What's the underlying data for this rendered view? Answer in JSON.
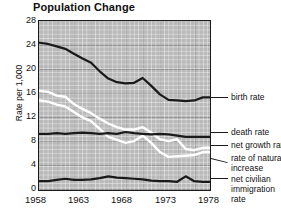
{
  "chart_data": {
    "type": "line",
    "title": "Population Change",
    "xlabel": "",
    "ylabel": "Rate per 1,000",
    "xlim": [
      1958,
      1978
    ],
    "ylim": [
      0,
      28
    ],
    "yticks": [
      0,
      4,
      8,
      12,
      16,
      20,
      24,
      28
    ],
    "xticks": [
      1958,
      1963,
      1968,
      1973,
      1978
    ],
    "grid": true,
    "legend_position": "right-inline-labels",
    "x": [
      1958,
      1959,
      1960,
      1961,
      1962,
      1963,
      1964,
      1965,
      1966,
      1967,
      1968,
      1969,
      1970,
      1971,
      1972,
      1973,
      1974,
      1975,
      1976,
      1977,
      1978
    ],
    "series": [
      {
        "name": "birth rate",
        "color": "#1a1a1a",
        "values": [
          24.5,
          24.3,
          23.9,
          23.5,
          22.7,
          21.9,
          21.2,
          19.8,
          18.6,
          18.0,
          17.8,
          17.9,
          18.7,
          17.4,
          16.0,
          15.1,
          15.0,
          14.9,
          15.0,
          15.5,
          15.5
        ]
      },
      {
        "name": "death rate",
        "color": "#1a1a1a",
        "values": [
          9.5,
          9.5,
          9.6,
          9.5,
          9.6,
          9.7,
          9.6,
          9.5,
          9.6,
          9.5,
          9.8,
          9.6,
          9.5,
          9.4,
          9.5,
          9.4,
          9.2,
          9.0,
          9.0,
          9.0,
          9.0
        ]
      },
      {
        "name": "net growth rate",
        "color": "#ffffff",
        "values": [
          16.6,
          16.4,
          15.8,
          15.6,
          14.4,
          13.6,
          12.9,
          12.0,
          11.2,
          10.6,
          10.2,
          10.2,
          10.6,
          9.7,
          8.6,
          8.3,
          8.6,
          7.0,
          6.8,
          7.2,
          7.2
        ]
      },
      {
        "name": "rate of natural increase",
        "color": "#ffffff",
        "values": [
          15.0,
          14.8,
          14.3,
          14.0,
          13.1,
          12.2,
          11.6,
          10.3,
          9.0,
          8.5,
          8.0,
          8.3,
          9.2,
          8.0,
          6.5,
          5.7,
          5.8,
          5.9,
          6.0,
          6.5,
          6.5
        ]
      },
      {
        "name": "net civilian immigration rate",
        "color": "#1a1a1a",
        "values": [
          1.7,
          1.7,
          1.9,
          2.1,
          1.9,
          1.9,
          2.0,
          2.2,
          2.5,
          2.3,
          2.2,
          2.1,
          2.0,
          1.8,
          1.7,
          1.7,
          1.6,
          2.5,
          1.7,
          1.6,
          1.6
        ]
      }
    ]
  },
  "title": "Population Change",
  "axis": {
    "ylabel": "Rate per 1,000",
    "yticks": [
      "28",
      "24",
      "20",
      "16",
      "12",
      "8",
      "4",
      "0"
    ],
    "xticks": [
      "1958",
      "1963",
      "1968",
      "1973",
      "1978"
    ]
  },
  "legend": {
    "birth_rate": "birth rate",
    "death_rate": "death rate",
    "net_growth_rate": "net growth rate",
    "natural_increase_line1": "rate of natural",
    "natural_increase_line2": "increase",
    "immigration_line1": "net civilian",
    "immigration_line2": "immigration",
    "immigration_line3": "rate"
  },
  "colors": {
    "plot_background": "#b9b9b9",
    "dark_line": "#1a1a1a",
    "light_line": "#ffffff",
    "text": "#111111"
  }
}
